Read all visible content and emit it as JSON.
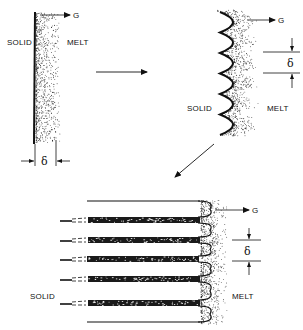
{
  "figure": {
    "colors": {
      "ink": "#111111",
      "background": "#ffffff"
    },
    "panels": [
      {
        "id": "planar",
        "labels": {
          "solid": "SOLID",
          "melt": "MELT",
          "gradient": "G",
          "delta": "δ"
        }
      },
      {
        "id": "cellular",
        "labels": {
          "solid": "SOLID",
          "melt": "MELT",
          "gradient": "G",
          "delta": "δ"
        },
        "cusp_count": 6
      },
      {
        "id": "elongated-cells",
        "labels": {
          "solid": "SOLID",
          "melt": "MELT",
          "gradient": "G",
          "delta": "δ"
        },
        "cell_count": 6
      }
    ],
    "transitions": [
      {
        "from": "planar",
        "to": "cellular",
        "icon": "arrow-right-icon"
      },
      {
        "from": "cellular",
        "to": "elongated-cells",
        "icon": "arrow-down-left-icon"
      }
    ]
  }
}
